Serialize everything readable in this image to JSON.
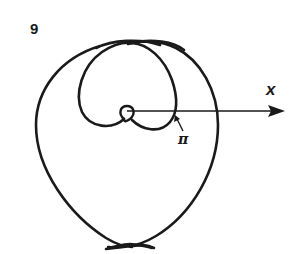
{
  "figure": {
    "number": "9",
    "axis": {
      "label": "x",
      "direction": "positive x-axis, arrow pointing right"
    },
    "annotation": {
      "label": "π",
      "points_to": "intersection of inner loop with the x-axis"
    },
    "colors": {
      "stroke": "#1a1a1a",
      "background": "#ffffff"
    }
  }
}
